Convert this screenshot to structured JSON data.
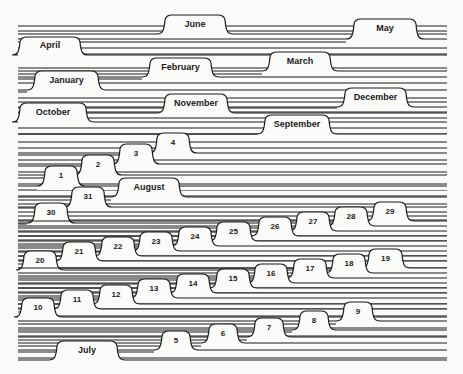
{
  "colors": {
    "ink": "#1a1a1a",
    "paper": "#fbfbf9"
  },
  "canvas": {
    "width": 463,
    "height": 374,
    "line_left": 18,
    "line_right": 447
  },
  "ruled_lines": [
    26,
    31,
    42,
    48,
    54,
    58,
    68,
    74,
    79,
    83,
    92,
    98,
    102,
    108,
    112,
    118,
    128,
    134,
    142,
    148,
    155,
    160,
    166,
    172,
    178,
    184,
    190,
    196,
    200,
    204,
    208,
    212,
    216,
    220,
    224,
    228,
    232,
    236,
    240,
    244,
    248,
    252,
    256,
    260,
    264,
    268,
    272,
    276,
    280,
    284,
    288,
    292,
    296,
    300,
    304,
    308,
    312,
    316,
    320,
    324,
    328,
    332,
    336,
    340,
    346,
    352,
    358
  ],
  "tabs": [
    {
      "label": "June",
      "x": 163,
      "y": 15,
      "w": 64,
      "h": 17,
      "size": 9
    },
    {
      "label": "May",
      "x": 352,
      "y": 19,
      "w": 66,
      "h": 18,
      "size": 9
    },
    {
      "label": "April",
      "x": 18,
      "y": 37,
      "w": 64,
      "h": 16,
      "size": 9
    },
    {
      "label": "March",
      "x": 268,
      "y": 52,
      "w": 64,
      "h": 17,
      "size": 9
    },
    {
      "label": "February",
      "x": 148,
      "y": 58,
      "w": 65,
      "h": 17,
      "size": 9
    },
    {
      "label": "January",
      "x": 33,
      "y": 71,
      "w": 67,
      "h": 17,
      "size": 9
    },
    {
      "label": "December",
      "x": 343,
      "y": 88,
      "w": 65,
      "h": 17,
      "size": 9
    },
    {
      "label": "November",
      "x": 163,
      "y": 94,
      "w": 66,
      "h": 17,
      "size": 9
    },
    {
      "label": "October",
      "x": 18,
      "y": 103,
      "w": 70,
      "h": 17,
      "size": 9
    },
    {
      "label": "September",
      "x": 263,
      "y": 115,
      "w": 68,
      "h": 17,
      "size": 9
    },
    {
      "label": "4",
      "x": 155,
      "y": 133,
      "w": 36,
      "h": 18,
      "size": 8
    },
    {
      "label": "3",
      "x": 118,
      "y": 144,
      "w": 36,
      "h": 18,
      "size": 8
    },
    {
      "label": "2",
      "x": 80,
      "y": 155,
      "w": 36,
      "h": 18,
      "size": 8
    },
    {
      "label": "1",
      "x": 43,
      "y": 166,
      "w": 36,
      "h": 18,
      "size": 8
    },
    {
      "label": "August",
      "x": 117,
      "y": 178,
      "w": 64,
      "h": 17,
      "size": 9
    },
    {
      "label": "31",
      "x": 70,
      "y": 187,
      "w": 36,
      "h": 18,
      "size": 8
    },
    {
      "label": "30",
      "x": 33,
      "y": 203,
      "w": 36,
      "h": 18,
      "size": 8
    },
    {
      "label": "29",
      "x": 372,
      "y": 202,
      "w": 36,
      "h": 17,
      "size": 8
    },
    {
      "label": "28",
      "x": 333,
      "y": 207,
      "w": 36,
      "h": 17,
      "size": 8
    },
    {
      "label": "27",
      "x": 295,
      "y": 212,
      "w": 36,
      "h": 17,
      "size": 8
    },
    {
      "label": "26",
      "x": 257,
      "y": 217,
      "w": 36,
      "h": 17,
      "size": 8
    },
    {
      "label": "25",
      "x": 215,
      "y": 222,
      "w": 37,
      "h": 17,
      "size": 8
    },
    {
      "label": "24",
      "x": 177,
      "y": 227,
      "w": 36,
      "h": 17,
      "size": 8
    },
    {
      "label": "23",
      "x": 138,
      "y": 232,
      "w": 36,
      "h": 17,
      "size": 8
    },
    {
      "label": "22",
      "x": 100,
      "y": 237,
      "w": 36,
      "h": 17,
      "size": 8
    },
    {
      "label": "21",
      "x": 61,
      "y": 242,
      "w": 36,
      "h": 17,
      "size": 8
    },
    {
      "label": "20",
      "x": 22,
      "y": 251,
      "w": 36,
      "h": 17,
      "size": 8
    },
    {
      "label": "19",
      "x": 367,
      "y": 249,
      "w": 37,
      "h": 17,
      "size": 8
    },
    {
      "label": "18",
      "x": 331,
      "y": 254,
      "w": 36,
      "h": 17,
      "size": 8
    },
    {
      "label": "17",
      "x": 292,
      "y": 259,
      "w": 36,
      "h": 17,
      "size": 8
    },
    {
      "label": "16",
      "x": 253,
      "y": 264,
      "w": 36,
      "h": 17,
      "size": 8
    },
    {
      "label": "15",
      "x": 215,
      "y": 269,
      "w": 36,
      "h": 17,
      "size": 8
    },
    {
      "label": "14",
      "x": 175,
      "y": 274,
      "w": 36,
      "h": 17,
      "size": 8
    },
    {
      "label": "13",
      "x": 136,
      "y": 279,
      "w": 36,
      "h": 17,
      "size": 8
    },
    {
      "label": "12",
      "x": 98,
      "y": 285,
      "w": 36,
      "h": 17,
      "size": 8
    },
    {
      "label": "11",
      "x": 59,
      "y": 290,
      "w": 36,
      "h": 17,
      "size": 8
    },
    {
      "label": "10",
      "x": 20,
      "y": 298,
      "w": 36,
      "h": 17,
      "size": 8
    },
    {
      "label": "9",
      "x": 342,
      "y": 302,
      "w": 32,
      "h": 17,
      "size": 8
    },
    {
      "label": "8",
      "x": 298,
      "y": 311,
      "w": 32,
      "h": 17,
      "size": 8
    },
    {
      "label": "7",
      "x": 253,
      "y": 318,
      "w": 32,
      "h": 17,
      "size": 8
    },
    {
      "label": "6",
      "x": 207,
      "y": 324,
      "w": 32,
      "h": 17,
      "size": 8
    },
    {
      "label": "5",
      "x": 160,
      "y": 331,
      "w": 32,
      "h": 17,
      "size": 8
    },
    {
      "label": "July",
      "x": 55,
      "y": 341,
      "w": 64,
      "h": 17,
      "size": 9
    }
  ]
}
